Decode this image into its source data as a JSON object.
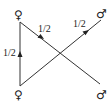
{
  "diagram": {
    "nodes": {
      "top_left": {
        "symbol": "♀",
        "meaning": "female"
      },
      "bottom_left": {
        "symbol": "♀",
        "meaning": "female"
      },
      "top_right": {
        "symbol": "♂",
        "meaning": "male"
      },
      "bottom_right": {
        "symbol": "♂",
        "meaning": "male"
      }
    },
    "edges": [
      {
        "from": "bottom_left",
        "to": "top_left",
        "label": "1/2",
        "arrow": true
      },
      {
        "from": "top_left",
        "to": "bottom_right",
        "label": "1/2",
        "arrow": true
      },
      {
        "from": "bottom_left",
        "to": "top_right",
        "label": "1/2",
        "arrow": true
      }
    ],
    "colors": {
      "line": "#333333",
      "text": "#222222",
      "background": "#ffffff"
    }
  }
}
